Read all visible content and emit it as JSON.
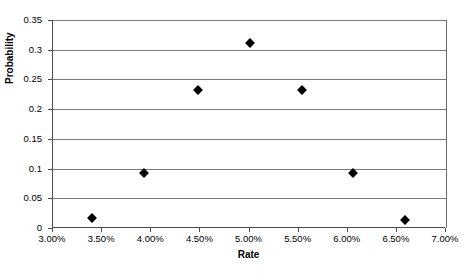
{
  "chart_data": {
    "type": "scatter",
    "title": "",
    "xlabel": "Rate",
    "ylabel": "Probability",
    "xlim": [
      3.0,
      7.0
    ],
    "ylim": [
      0,
      0.35
    ],
    "grid": true,
    "legend": false,
    "x_tick_labels": [
      "3.00%",
      "3.50%",
      "4.00%",
      "4.50%",
      "5.00%",
      "5.50%",
      "6.00%",
      "6.50%",
      "7.00%"
    ],
    "x_ticks": [
      3.0,
      3.5,
      4.0,
      4.5,
      5.0,
      5.5,
      6.0,
      6.5,
      7.0
    ],
    "y_tick_labels": [
      "0",
      "0.05",
      "0.1",
      "0.15",
      "0.2",
      "0.25",
      "0.3",
      "0.35"
    ],
    "y_ticks": [
      0,
      0.05,
      0.1,
      0.15,
      0.2,
      0.25,
      0.3,
      0.35
    ],
    "series": [
      {
        "name": "Probability",
        "marker": "diamond",
        "color": "#000000",
        "x": [
          3.4,
          3.93,
          4.48,
          5.01,
          5.53,
          6.05,
          6.58
        ],
        "y": [
          0.016,
          0.093,
          0.233,
          0.311,
          0.233,
          0.092,
          0.014
        ]
      }
    ]
  },
  "colors": {
    "gridline": "#7a7a7a",
    "axis": "#4d4d4d",
    "marker": "#000000",
    "background": "#ffffff"
  }
}
